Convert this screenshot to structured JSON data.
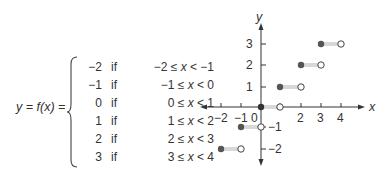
{
  "equation": {
    "lhs": "y = f(x) =",
    "cases": [
      {
        "value": "−2",
        "if": "if",
        "cond_left": "−2 ≤ ",
        "var": "x",
        "cond_right": " < −1"
      },
      {
        "value": "−1",
        "if": "if",
        "cond_left": "−1 ≤ ",
        "var": "x",
        "cond_right": " < 0"
      },
      {
        "value": "0",
        "if": "if",
        "cond_left": "0 ≤ ",
        "var": "x",
        "cond_right": " < 1"
      },
      {
        "value": "1",
        "if": "if",
        "cond_left": "1 ≤ ",
        "var": "x",
        "cond_right": " < 2"
      },
      {
        "value": "2",
        "if": "if",
        "cond_left": "2 ≤ ",
        "var": "x",
        "cond_right": " < 3"
      },
      {
        "value": "3",
        "if": "if",
        "cond_left": "3 ≤ ",
        "var": "x",
        "cond_right": " < 4"
      }
    ]
  },
  "graph": {
    "x_axis_label": "x",
    "y_axis_label": "y",
    "x_tick_labels": [
      "−2",
      "−1",
      "0",
      "2",
      "3",
      "4"
    ],
    "y_tick_labels": [
      "3",
      "2",
      "1",
      "−1",
      "−2"
    ],
    "segment_color": "#d8d8d8",
    "closed_dot_color": "#555555",
    "axis_color": "#333333",
    "segments": [
      {
        "x_start": -2,
        "x_end": -1,
        "y": -2
      },
      {
        "x_start": -1,
        "x_end": 0,
        "y": -1
      },
      {
        "x_start": 0,
        "x_end": 1,
        "y": 0
      },
      {
        "x_start": 1,
        "x_end": 2,
        "y": 1
      },
      {
        "x_start": 2,
        "x_end": 3,
        "y": 2
      },
      {
        "x_start": 3,
        "x_end": 4,
        "y": 3
      }
    ]
  }
}
